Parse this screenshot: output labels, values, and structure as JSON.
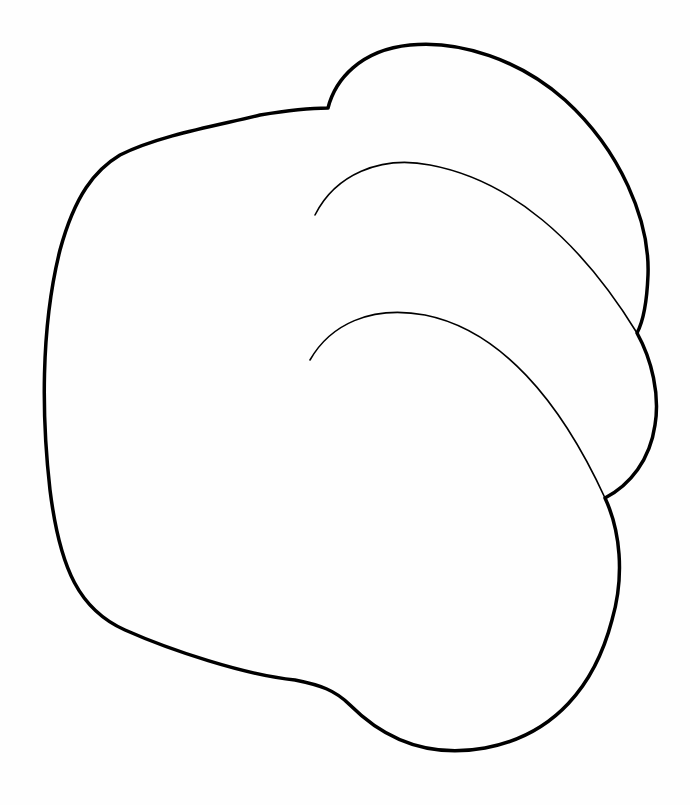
{
  "drawing": {
    "subject": "outline line drawing of a rounded lobed shape (fist/paw-like) with two inner curved fold lines",
    "background_color": "#ffffff",
    "stroke_color": "#000000",
    "outer_stroke_width": 3.5,
    "inner_stroke_width": 1.5,
    "caption": ""
  }
}
